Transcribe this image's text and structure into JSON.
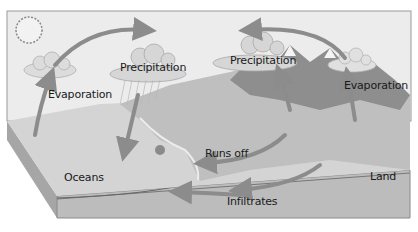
{
  "diagram": {
    "labels": {
      "evaporation_left": "Evaporation",
      "precipitation_left": "Precipitation",
      "precipitation_right": "Precipitation",
      "evaporation_right": "Evaporation",
      "runs_off": "Runs off",
      "oceans": "Oceans",
      "land": "Land",
      "infiltrates": "Infiltrates"
    },
    "icons": [
      "sun-icon",
      "cloud-icon",
      "rain-icon",
      "mountain-icon",
      "arrow-icon"
    ],
    "colors": {
      "sky": "#e6e6e6",
      "ground": "#b8b8b8",
      "arrow": "#8c8c8c",
      "text": "#1a1a1a"
    }
  }
}
